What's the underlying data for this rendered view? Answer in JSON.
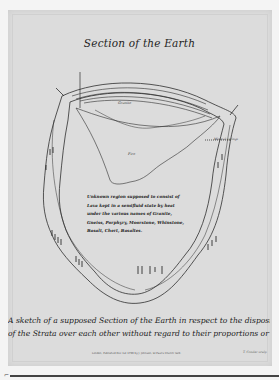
{
  "plate": {
    "title": "Section of the Earth",
    "caption_line_1": "A sketch of a supposed Section of the Earth in respect to the disposition",
    "caption_line_2": "of the Strata over each other without regard to their proportions or number",
    "imprint": "London, Published Dec 1st 1799 by J. Johnson, St Paul's Church Yard.",
    "engraver": "T. Conder sculp"
  },
  "diagram": {
    "central_region_text": "Unknown region supposed to consist of Lava kept in a semifluid state by heat under the various names of Granite, Gneiss, Porphyry, Moorstone, Whinstone, Basalt, Chert, Basaltes.",
    "labels": {
      "top_layers": [
        "Sea",
        "Limestone",
        "Sandstone",
        "Limestone",
        "Chalk",
        "Sand",
        "Clay"
      ],
      "upper_region": "Granite",
      "inner_region": "Fire",
      "left_vertical": "Granite",
      "right_vertical": "Granite",
      "right_side": "Mineral springs",
      "left_top": "Vertical Strata",
      "right_top": "Volcano"
    }
  },
  "colors": {
    "paper": "#dcdcdc",
    "ink": "#2a2a2a",
    "margin": "#f4f4f4"
  }
}
